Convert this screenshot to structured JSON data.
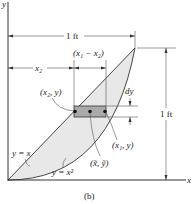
{
  "figure": {
    "caption": "(b)",
    "axes": {
      "x_label": "x",
      "y_label": "y"
    },
    "curves": [
      {
        "label": "y = x",
        "type": "line"
      },
      {
        "label": "y = x²",
        "type": "parabola"
      }
    ],
    "dimensions": {
      "top_width": "1 ft",
      "right_height": "1 ft",
      "x2": "x₂",
      "difference": "(x₁ − x₂)",
      "dy": "dy"
    },
    "points": {
      "left": "(x₂, y)",
      "right": "(x₁, y)",
      "centroid": "(x̃, ỹ)"
    },
    "colors": {
      "line": "#333333",
      "region_fill": "#e6e6e6",
      "element_fill": "#aaaaaa",
      "text": "#222222"
    }
  }
}
